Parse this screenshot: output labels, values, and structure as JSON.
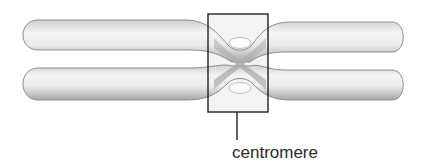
{
  "diagram": {
    "structure": "duplicated chromosome with two sister chromatids",
    "labels": [
      {
        "text": "centromere",
        "target": "centromere-region"
      }
    ],
    "colors": {
      "background": "#ffffff",
      "chromatid_fill": "#e6e6e6",
      "chromatid_shadow": "#9a9a9a",
      "centromere_fill": "#b5b5b5",
      "box_stroke": "#222222",
      "label_text": "#2a2a2a"
    }
  }
}
